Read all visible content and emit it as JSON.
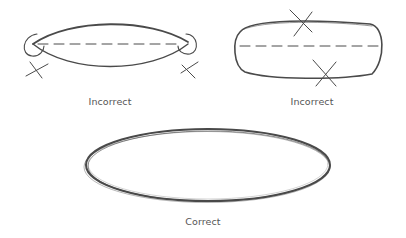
{
  "figure": {
    "panels": [
      {
        "id": "incorrect-pointed-ends",
        "caption": "Incorrect",
        "error": "pointed ends"
      },
      {
        "id": "incorrect-flat-sides",
        "caption": "Incorrect",
        "error": "flat sides"
      },
      {
        "id": "correct-ellipse",
        "caption": "Correct"
      }
    ],
    "colors": {
      "stroke": "#4a4a4a",
      "caption": "#555555",
      "background": "#ffffff"
    }
  }
}
